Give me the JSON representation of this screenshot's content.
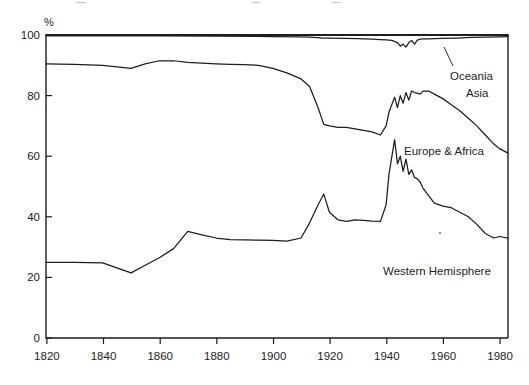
{
  "figure": {
    "axis_unit_label": "%",
    "background_color": "#ffffff",
    "line_color": "#1d1d1d"
  },
  "chart_data": {
    "type": "line",
    "title": "",
    "subtitle": "",
    "xlabel": "",
    "ylabel": "%",
    "xlim": [
      1820,
      1983
    ],
    "ylim": [
      0,
      100
    ],
    "grid": false,
    "legend_position": "inline-right",
    "xticks": [
      1820,
      1840,
      1860,
      1880,
      1900,
      1920,
      1940,
      1960,
      1980
    ],
    "xtick_labels": [
      "1820",
      "1840",
      "1860",
      "1880",
      "1900",
      "1920",
      "1940",
      "1960",
      "1980"
    ],
    "yticks": [
      0,
      20,
      40,
      60,
      80,
      100
    ],
    "ytick_labels": [
      "0",
      "20",
      "40",
      "60",
      "80",
      "100"
    ],
    "annotations": [
      {
        "text": "Oceania",
        "x": 1962,
        "y": 93.5
      },
      {
        "text": "Asia",
        "x": 1972,
        "y": 84.5
      },
      {
        "text": "Europe & Africa",
        "x": 1953,
        "y": 64.5
      },
      {
        "text": "Western Hemisphere",
        "x": 1938,
        "y": 25.5
      }
    ],
    "series": [
      {
        "name": "Western Hemisphere",
        "label": "Western Hemisphere",
        "x": [
          1820,
          1830,
          1840,
          1850,
          1855,
          1860,
          1865,
          1870,
          1875,
          1880,
          1885,
          1890,
          1895,
          1900,
          1905,
          1910,
          1913,
          1916,
          1918,
          1920,
          1923,
          1926,
          1929,
          1932,
          1935,
          1938,
          1940,
          1941,
          1943,
          1944,
          1945,
          1946,
          1947,
          1948,
          1949,
          1950,
          1951,
          1952,
          1953,
          1955,
          1957,
          1960,
          1963,
          1966,
          1969,
          1972,
          1975,
          1978,
          1980,
          1983
        ],
        "values": [
          25.0,
          25.0,
          24.8,
          21.5,
          24.0,
          26.5,
          29.5,
          35.2,
          34.0,
          33.0,
          32.5,
          32.4,
          32.3,
          32.2,
          32.0,
          33.0,
          38.0,
          44.0,
          47.5,
          41.5,
          39.0,
          38.5,
          39.0,
          38.8,
          38.6,
          38.5,
          44.0,
          54.0,
          65.5,
          57.5,
          60.0,
          55.0,
          59.0,
          54.0,
          55.5,
          53.0,
          52.5,
          51.5,
          49.5,
          47.0,
          44.5,
          43.5,
          43.0,
          41.5,
          40.0,
          37.5,
          34.5,
          33.0,
          33.5,
          33.0
        ]
      },
      {
        "name": "Europe & Africa (cumulative upper bound)",
        "label": "Europe & Africa",
        "x": [
          1820,
          1830,
          1840,
          1850,
          1855,
          1860,
          1865,
          1870,
          1875,
          1880,
          1885,
          1890,
          1895,
          1900,
          1905,
          1910,
          1913,
          1916,
          1918,
          1920,
          1923,
          1926,
          1929,
          1932,
          1935,
          1938,
          1940,
          1941,
          1943,
          1944,
          1945,
          1946,
          1947,
          1948,
          1949,
          1950,
          1951,
          1952,
          1953,
          1955,
          1957,
          1960,
          1963,
          1966,
          1969,
          1972,
          1975,
          1978,
          1980,
          1983
        ],
        "values": [
          90.5,
          90.3,
          90.0,
          89.0,
          90.5,
          91.5,
          91.5,
          91.0,
          90.7,
          90.5,
          90.3,
          90.2,
          90.0,
          89.0,
          87.5,
          85.5,
          83.0,
          76.0,
          70.5,
          70.0,
          69.5,
          69.5,
          69.0,
          68.5,
          68.0,
          67.0,
          70.0,
          74.5,
          79.5,
          76.0,
          80.0,
          77.5,
          81.0,
          78.5,
          81.5,
          81.0,
          80.8,
          80.5,
          81.5,
          81.5,
          80.5,
          79.0,
          77.0,
          75.0,
          72.5,
          70.0,
          67.0,
          64.0,
          62.5,
          61.0
        ]
      },
      {
        "name": "Asia (cumulative upper bound / Oceania boundary)",
        "label": "Oceania",
        "x": [
          1820,
          1840,
          1860,
          1880,
          1900,
          1910,
          1913,
          1918,
          1920,
          1925,
          1930,
          1935,
          1938,
          1940,
          1942,
          1944,
          1945,
          1946,
          1947,
          1948,
          1949,
          1950,
          1951,
          1952,
          1953,
          1955,
          1957,
          1960,
          1965,
          1970,
          1975,
          1980,
          1983
        ],
        "values": [
          99.7,
          99.7,
          99.7,
          99.6,
          99.5,
          99.4,
          99.3,
          99.0,
          99.0,
          98.9,
          98.8,
          98.6,
          98.5,
          98.4,
          98.2,
          97.5,
          96.3,
          97.0,
          96.0,
          97.5,
          98.2,
          97.0,
          98.3,
          98.6,
          98.7,
          98.7,
          98.8,
          98.9,
          99.0,
          99.2,
          99.3,
          99.4,
          99.5
        ]
      },
      {
        "name": "World total (100%)",
        "label": "",
        "x": [
          1820,
          1983
        ],
        "values": [
          100,
          100
        ]
      }
    ]
  }
}
